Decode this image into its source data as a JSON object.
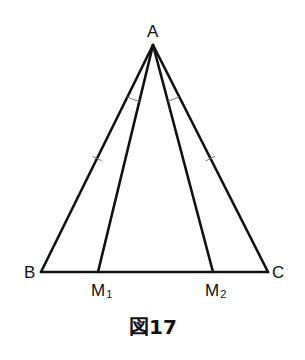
{
  "figure": {
    "caption": "図17",
    "vertices": {
      "A": {
        "label": "A"
      },
      "B": {
        "label": "B"
      },
      "C": {
        "label": "C"
      },
      "M1": {
        "label": "M",
        "subscript": "1"
      },
      "M2": {
        "label": "M",
        "subscript": "2"
      }
    },
    "segments": [
      {
        "name": "AB",
        "from": "A",
        "to": "B",
        "tick_marks": 1
      },
      {
        "name": "AC",
        "from": "A",
        "to": "C",
        "tick_marks": 1
      },
      {
        "name": "BC",
        "from": "B",
        "to": "C",
        "tick_marks": 0
      },
      {
        "name": "AM1",
        "from": "A",
        "to": "M1",
        "tick_marks": 0
      },
      {
        "name": "AM2",
        "from": "A",
        "to": "M2",
        "tick_marks": 0
      }
    ],
    "angle_marks": [
      {
        "name": "angle-BAM1",
        "arcs": 1
      },
      {
        "name": "angle-M2AC",
        "arcs": 1
      }
    ],
    "line_color": "#111111"
  }
}
